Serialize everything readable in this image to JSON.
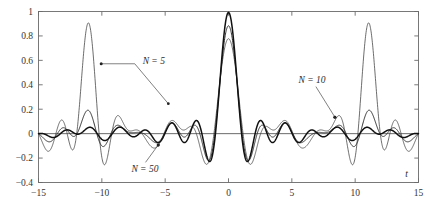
{
  "chart_data": {
    "type": "line",
    "title": "",
    "subtitle": "",
    "xlabel": "t",
    "ylabel": "",
    "xlim": [
      -15,
      15
    ],
    "ylim": [
      -0.4,
      1.0
    ],
    "grid": false,
    "legend_position": "inline-annotations",
    "x_ticks": [
      -15,
      -10,
      -5,
      0,
      5,
      10,
      15
    ],
    "x_tick_labels": [
      "−15",
      "−10",
      "−5",
      "0",
      "5",
      "10",
      "15"
    ],
    "y_ticks": [
      -0.4,
      -0.2,
      0,
      0.2,
      0.4,
      0.6,
      0.8,
      1
    ],
    "y_tick_labels": [
      "−0.4",
      "−0.2",
      "0",
      "0.2",
      "0.4",
      "0.6",
      "0.8",
      "1"
    ],
    "zero_line": 0,
    "annotations": [
      {
        "text": "N = 5",
        "label_x": -5.9,
        "label_y": 0.6,
        "leader": [
          [
            -10.05,
            0.572
          ],
          [
            -7.4,
            0.572
          ],
          [
            -4.75,
            0.245
          ]
        ],
        "marker": [
          -10.05,
          0.572
        ],
        "arrow_at": [
          -4.75,
          0.245
        ]
      },
      {
        "text": "N = 10",
        "label_x": 6.6,
        "label_y": 0.445,
        "leader": [
          [
            8.4,
            0.135
          ],
          [
            6.9,
            0.385
          ]
        ],
        "marker": [
          8.4,
          0.135
        ],
        "arrow_at": [
          8.4,
          0.135
        ]
      },
      {
        "text": "N = 50",
        "label_x": -6.6,
        "label_y": -0.285,
        "leader": [
          [
            -5.55,
            -0.093
          ],
          [
            -6.55,
            -0.235
          ]
        ],
        "marker": [
          -5.55,
          -0.093
        ],
        "arrow_at": [
          -5.55,
          -0.093
        ]
      }
    ],
    "series": [
      {
        "name": "N = 5",
        "N": 5,
        "color": "#3c3c3c",
        "width": 0.75,
        "kernel": "truncated-sinc-reconstruction",
        "main_peak": 0.81,
        "alias_peak": 0.81,
        "alias_centers": [
          -11,
          11
        ],
        "sidelobe_peak": 0.25,
        "min_value": -0.355,
        "description": "Coarsest truncation: large ripples and a full-amplitude aliasing replica near t = +/-11"
      },
      {
        "name": "N = 10",
        "N": 10,
        "color": "#2e2e2e",
        "width": 1.0,
        "kernel": "truncated-sinc-reconstruction",
        "main_peak": 0.9,
        "alias_peak": 0.14,
        "alias_centers": [
          -11,
          11
        ],
        "sidelobe_peak": 0.13,
        "min_value": -0.2,
        "description": "Intermediate truncation: moderate ripples, small aliasing replicas"
      },
      {
        "name": "N = 50",
        "N": 50,
        "color": "#111111",
        "width": 1.5,
        "kernel": "truncated-sinc-reconstruction",
        "main_peak": 1.0,
        "alias_peak": 0.03,
        "alias_centers": [
          -11,
          11
        ],
        "sidelobe_peak": 0.06,
        "min_value": -0.22,
        "description": "Finest truncation: closest to ideal sinc, smallest ripples"
      }
    ],
    "x_sample_step": 0.02
  },
  "axes": {
    "frame_color": "#6b6b6b",
    "tick_color": "#6b6b6b",
    "zero_line_color": "#5a5a5a",
    "background": "#ffffff"
  }
}
